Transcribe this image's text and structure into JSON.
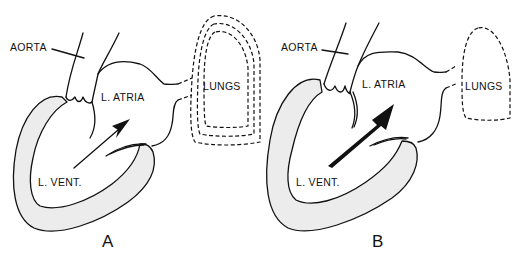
{
  "diagram": {
    "panels": [
      {
        "id": "A",
        "label": "A",
        "labels": {
          "aorta": "AORTA",
          "atria": "L. ATRIA",
          "ventricle": "L. VENT.",
          "lungs": "LUNGS"
        },
        "arrow": "thin",
        "lung_outlines": 3
      },
      {
        "id": "B",
        "label": "B",
        "labels": {
          "aorta": "AORTA",
          "atria": "L. ATRIA",
          "ventricle": "L. VENT.",
          "lungs": "LUNGS"
        },
        "arrow": "thick",
        "lung_outlines": 1
      }
    ],
    "colors": {
      "line": "#111111",
      "wall_fill": "#ececec",
      "background": "#ffffff"
    }
  }
}
